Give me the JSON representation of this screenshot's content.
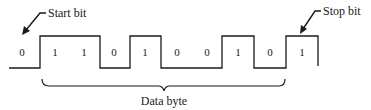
{
  "diagram": {
    "labels": {
      "start_bit": "Start bit",
      "stop_bit": "Stop bit",
      "data_byte": "Data byte"
    },
    "bits": [
      {
        "value": "0",
        "role": "idle"
      },
      {
        "value": "1",
        "role": "data"
      },
      {
        "value": "1",
        "role": "data"
      },
      {
        "value": "0",
        "role": "data"
      },
      {
        "value": "1",
        "role": "data"
      },
      {
        "value": "0",
        "role": "data"
      },
      {
        "value": "0",
        "role": "data"
      },
      {
        "value": "1",
        "role": "data"
      },
      {
        "value": "0",
        "role": "data"
      },
      {
        "value": "1",
        "role": "stop"
      }
    ],
    "colors": {
      "line": "#1a1a1a",
      "background": "#ffffff"
    }
  }
}
